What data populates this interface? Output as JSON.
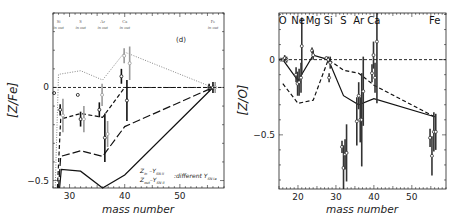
{
  "chart_data": [
    {
      "type": "line",
      "panel": "left",
      "panel_label": "(d)",
      "xlabel": "mass number",
      "ylabel": "[Z/Fe]",
      "xlim": [
        27,
        58
      ],
      "ylim": [
        -0.54,
        0.4
      ],
      "xticks": [
        30,
        40,
        50
      ],
      "yticks": [
        0,
        -0.5
      ],
      "ytick_labels": [
        "0",
        "-0.5"
      ],
      "reference_line": {
        "y": 0,
        "style": "dashed"
      },
      "element_labels": [
        {
          "name": "Si",
          "sub": "in out",
          "x": 28
        },
        {
          "name": "S",
          "sub": "in out",
          "x": 32
        },
        {
          "name": "Ar",
          "sub": "in out",
          "x": 36
        },
        {
          "name": "Ca",
          "sub": "in out",
          "x": 40
        },
        {
          "name": "Fe",
          "sub": "in out",
          "x": 56
        }
      ],
      "legend": {
        "line1_main": "Z",
        "line1_sub": "in",
        "line1_rest": " –Y",
        "line1_rest_sub": "SN II",
        "line2_main": "Z",
        "line2_sub": "out",
        "line2_rest": "–Y",
        "line2_rest_sub": "SN II",
        "suffix": ":different Y",
        "suffix_sub": "SN Ia"
      },
      "series": [
        {
          "name": "dotted-grey",
          "style": "dotted",
          "color": "#888888",
          "x": [
            27.4,
            28,
            32,
            36,
            40,
            56
          ],
          "y": [
            -0.55,
            0.07,
            0.09,
            0.04,
            0.19,
            0.0
          ]
        },
        {
          "name": "short-dash",
          "style": "dashed",
          "color": "#111111",
          "x": [
            27.8,
            28.4,
            32,
            36,
            40,
            56
          ],
          "y": [
            -0.55,
            -0.17,
            -0.14,
            -0.16,
            0.0,
            0.0
          ]
        },
        {
          "name": "long-dash",
          "style": "longdash",
          "color": "#111111",
          "x": [
            28,
            28.4,
            32,
            36,
            40,
            56
          ],
          "y": [
            -0.55,
            -0.37,
            -0.34,
            -0.37,
            -0.21,
            0.0
          ]
        },
        {
          "name": "solid",
          "style": "solid",
          "color": "#111111",
          "x": [
            28.2,
            28.5,
            32,
            36,
            40,
            56
          ],
          "y": [
            -0.55,
            -0.44,
            -0.45,
            -0.55,
            -0.47,
            0.0
          ]
        }
      ],
      "points": [
        {
          "x": 27.2,
          "y": -0.03,
          "err": 0.0,
          "color": "#111111"
        },
        {
          "x": 28.3,
          "y": -0.12,
          "err": 0.03,
          "color": "#111111"
        },
        {
          "x": 28.8,
          "y": -0.15,
          "err": 0.09,
          "color": "#999999"
        },
        {
          "x": 31.5,
          "y": -0.04,
          "err": 0.0,
          "color": "#111111"
        },
        {
          "x": 32.0,
          "y": -0.17,
          "err": 0.04,
          "color": "#111111"
        },
        {
          "x": 32.6,
          "y": -0.17,
          "err": 0.07,
          "color": "#999999"
        },
        {
          "x": 35.4,
          "y": -0.12,
          "err": 0.04,
          "color": "#111111"
        },
        {
          "x": 35.9,
          "y": -0.04,
          "err": 0.06,
          "color": "#999999"
        },
        {
          "x": 36.4,
          "y": -0.27,
          "err": 0.13,
          "color": "#111111"
        },
        {
          "x": 36.9,
          "y": -0.25,
          "err": 0.07,
          "color": "#999999"
        },
        {
          "x": 39.4,
          "y": 0.06,
          "err": 0.04,
          "color": "#111111"
        },
        {
          "x": 39.9,
          "y": 0.17,
          "err": 0.04,
          "color": "#999999"
        },
        {
          "x": 40.4,
          "y": -0.07,
          "err": 0.11,
          "color": "#111111"
        },
        {
          "x": 40.9,
          "y": 0.13,
          "err": 0.09,
          "color": "#999999"
        },
        {
          "x": 55.3,
          "y": 0.0,
          "err": 0.02,
          "color": "#111111"
        },
        {
          "x": 56.0,
          "y": 0.0,
          "err": 0.03,
          "color": "#111111"
        },
        {
          "x": 56.4,
          "y": 0.0,
          "err": 0.03,
          "color": "#999999"
        }
      ]
    },
    {
      "type": "line",
      "panel": "right",
      "xlabel": "mass number",
      "ylabel": "[Z/O]",
      "xlim": [
        15,
        59
      ],
      "ylim": [
        -0.86,
        0.31
      ],
      "xticks": [
        20,
        30,
        40,
        50
      ],
      "yticks": [
        0,
        -0.5
      ],
      "ytick_labels": [
        "0",
        "-0.5"
      ],
      "reference_line": {
        "y": 0,
        "style": "dashed"
      },
      "element_labels": [
        {
          "name": "O",
          "x": 16
        },
        {
          "name": "Ne",
          "x": 20
        },
        {
          "name": "Mg",
          "x": 24
        },
        {
          "name": "Si",
          "x": 28
        },
        {
          "name": "S",
          "x": 32
        },
        {
          "name": "Ar",
          "x": 36
        },
        {
          "name": "Ca",
          "x": 40
        },
        {
          "name": "Fe",
          "x": 56
        }
      ],
      "series": [
        {
          "name": "solid",
          "style": "solid",
          "color": "#111111",
          "x": [
            16,
            20,
            24,
            28,
            32,
            36,
            40,
            56
          ],
          "y": [
            0.0,
            -0.14,
            0.03,
            0.0,
            -0.24,
            -0.3,
            -0.26,
            -0.38
          ]
        },
        {
          "name": "dashed",
          "style": "dashed",
          "color": "#111111",
          "x": [
            16,
            20,
            24,
            28,
            32,
            36,
            40,
            56
          ],
          "y": [
            -0.16,
            -0.29,
            -0.27,
            0.0,
            -0.07,
            -0.09,
            -0.17,
            -0.38
          ]
        }
      ],
      "points": [
        {
          "x": 15.5,
          "y": 0.0,
          "err": 0.0
        },
        {
          "x": 16.0,
          "y": 0.0,
          "err": 0.01
        },
        {
          "x": 16.5,
          "y": 0.01,
          "err": 0.02
        },
        {
          "x": 17.0,
          "y": 0.0,
          "err": 0.02
        },
        {
          "x": 19.5,
          "y": -0.1,
          "err": 0.05
        },
        {
          "x": 19.9,
          "y": -0.16,
          "err": 0.08
        },
        {
          "x": 20.3,
          "y": -0.15,
          "err": 0.09
        },
        {
          "x": 20.8,
          "y": -0.12,
          "err": 0.1
        },
        {
          "x": 21.0,
          "y": 0.09,
          "err": 0.19
        },
        {
          "x": 23.7,
          "y": 0.06,
          "err": 0.02
        },
        {
          "x": 24.0,
          "y": 0.03,
          "err": 0.03
        },
        {
          "x": 27.5,
          "y": 0.01,
          "err": 0.01
        },
        {
          "x": 28.0,
          "y": 0.0,
          "err": 0.02
        },
        {
          "x": 28.2,
          "y": -0.12,
          "err": 0.03
        },
        {
          "x": 28.5,
          "y": -0.02,
          "err": 0.04
        },
        {
          "x": 31.6,
          "y": -0.58,
          "err": 0.04
        },
        {
          "x": 32.0,
          "y": -0.72,
          "err": 0.15
        },
        {
          "x": 32.4,
          "y": -0.63,
          "err": 0.1
        },
        {
          "x": 32.8,
          "y": -0.62,
          "err": 0.19
        },
        {
          "x": 35.5,
          "y": -0.41,
          "err": 0.16
        },
        {
          "x": 36.0,
          "y": -0.24,
          "err": 0.09
        },
        {
          "x": 36.4,
          "y": -0.4,
          "err": 0.15
        },
        {
          "x": 36.8,
          "y": -0.4,
          "err": 0.31
        },
        {
          "x": 37.2,
          "y": -0.21,
          "err": 0.23
        },
        {
          "x": 39.5,
          "y": -0.09,
          "err": 0.06
        },
        {
          "x": 39.9,
          "y": 0.03,
          "err": 0.09
        },
        {
          "x": 40.3,
          "y": -0.12,
          "err": 0.1
        },
        {
          "x": 40.8,
          "y": 0.12,
          "err": 0.41
        },
        {
          "x": 54.8,
          "y": -0.52,
          "err": 0.06
        },
        {
          "x": 55.3,
          "y": -0.64,
          "err": 0.13
        },
        {
          "x": 55.8,
          "y": -0.48,
          "err": 0.13
        },
        {
          "x": 56.3,
          "y": -0.48,
          "err": 0.12
        }
      ]
    }
  ]
}
